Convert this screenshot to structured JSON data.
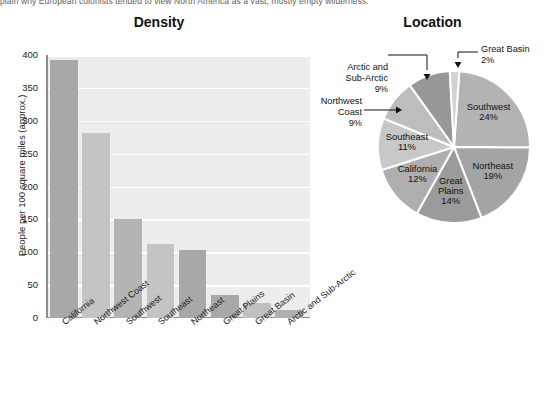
{
  "page": {
    "cut_off_text": "plain why European colonists tended to view North America as a vast, mostly empty wilderness."
  },
  "bar_chart": {
    "title": "Density",
    "ylabel": "People per 100 square miles (approx.)",
    "yticks": [
      "0",
      "50",
      "100",
      "150",
      "200",
      "250",
      "300",
      "350",
      "400"
    ]
  },
  "pie_chart": {
    "title": "Location",
    "callouts": [
      {
        "name": "arctic",
        "label": "Arctic and\nSub-Arctic\n9%"
      },
      {
        "name": "great-basin",
        "label": "Great Basin\n2%"
      },
      {
        "name": "northwest-coast",
        "label": "Northwest\nCoast\n9%"
      }
    ]
  },
  "chart_data": [
    {
      "type": "bar",
      "title": "Density",
      "xlabel": "",
      "ylabel": "People per 100 square miles (approx.)",
      "ylim": [
        0,
        400
      ],
      "ytick_step": 50,
      "grid": true,
      "legend": "none",
      "categories": [
        "California",
        "Northwest Coast",
        "Southwest",
        "Southeast",
        "Northeast",
        "Great Plains",
        "Great Basin",
        "Arctic and Sub-Arctic"
      ],
      "values": [
        393,
        282,
        151,
        112,
        103,
        35,
        23,
        12
      ],
      "bar_colors": [
        "#a8a8a8",
        "#c4c4c4",
        "#b4b4b4",
        "#c4c4c4",
        "#a8a8a8",
        "#a8a8a8",
        "#c0c0c0",
        "#b0b0b0"
      ],
      "plot_background": "#ededed",
      "gridline_color": "#ffffff"
    },
    {
      "type": "pie",
      "title": "Location",
      "labels": [
        "Southwest",
        "Northeast",
        "Great Plains",
        "California",
        "Southeast",
        "Northwest Coast",
        "Arctic and Sub-Arctic",
        "Great Basin"
      ],
      "values": [
        24,
        19,
        14,
        12,
        11,
        9,
        9,
        2
      ],
      "unit": "percent",
      "start_angle_deg": 4,
      "direction": "clockwise",
      "slice_colors": [
        "#b3b3b3",
        "#a4a4a4",
        "#9b9b9b",
        "#aeaeae",
        "#c8c8c8",
        "#bdbdbd",
        "#989898",
        "#d2d2d2"
      ],
      "slice_edge_color": "#ffffff",
      "label_placement": "inside-with-callouts",
      "callout_labels": [
        "Arctic and Sub-Arctic",
        "Great Basin",
        "Northwest Coast"
      ]
    }
  ]
}
